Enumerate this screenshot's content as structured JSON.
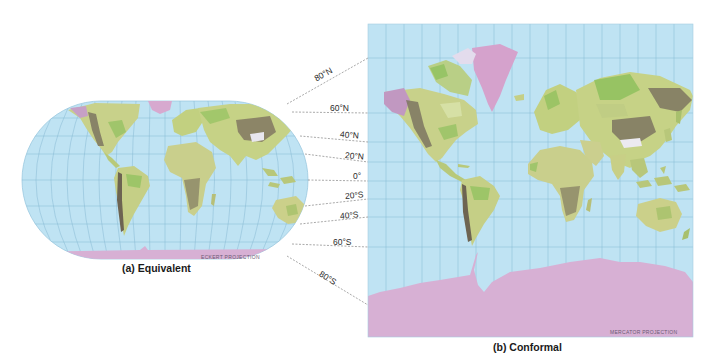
{
  "figure": {
    "left_map": {
      "caption": "(a) Equivalent",
      "projection_label": "ECKERT PROJECTION"
    },
    "right_map": {
      "caption": "(b) Conformal",
      "projection_label": "MERCATOR PROJECTION"
    },
    "latitude_labels": [
      {
        "label": "80°N"
      },
      {
        "label": "60°N"
      },
      {
        "label": "40°N"
      },
      {
        "label": "20°N"
      },
      {
        "label": "0°"
      },
      {
        "label": "20°S"
      },
      {
        "label": "40°S"
      },
      {
        "label": "60°S"
      },
      {
        "label": "80°S"
      }
    ],
    "colors": {
      "ocean": "#bfe3f3",
      "grid": "#7fb3cf",
      "land": "#c9d48a",
      "land_green": "#8bbf5a",
      "mountains": "#7d7560",
      "ice": "#d7a9cf"
    }
  }
}
